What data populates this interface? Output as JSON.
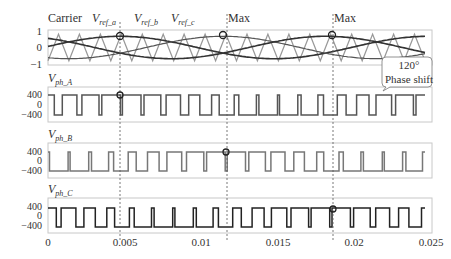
{
  "chart_data": [
    {
      "type": "line",
      "panel": "modulation",
      "title": "",
      "legend": [
        "Carrier",
        "V_ref_a",
        "V_ref_b",
        "V_ref_c"
      ],
      "yticks": [
        "1",
        "0",
        "-1"
      ],
      "ylim": [
        -1,
        1
      ],
      "xlim": [
        0,
        0.025
      ],
      "carrier": {
        "type": "triangle",
        "amplitude": 1,
        "cycles": 18
      },
      "series": [
        {
          "name": "V_ref_a",
          "amplitude": 0.8,
          "frequency_hz": 50,
          "phase_deg": 0
        },
        {
          "name": "V_ref_b",
          "amplitude": 0.8,
          "frequency_hz": 50,
          "phase_deg": -120
        },
        {
          "name": "V_ref_c",
          "amplitude": 0.8,
          "frequency_hz": 50,
          "phase_deg": 120
        }
      ],
      "annotations": [
        "Max",
        "Max"
      ],
      "markers_x": [
        0.0047,
        0.0117,
        0.0187
      ]
    },
    {
      "type": "line",
      "panel": "V_ph_A",
      "ylabel": "V_ph_A",
      "yticks": [
        "400",
        "0",
        "-400"
      ],
      "ylim": [
        -400,
        400
      ],
      "levels": [
        400,
        -400
      ]
    },
    {
      "type": "line",
      "panel": "V_ph_B",
      "ylabel": "V_ph_B",
      "yticks": [
        "400",
        "0",
        "-400"
      ],
      "ylim": [
        -400,
        400
      ],
      "levels": [
        400,
        -400
      ]
    },
    {
      "type": "line",
      "panel": "V_ph_C",
      "ylabel": "V_ph_C",
      "yticks": [
        "400",
        "0",
        "-400"
      ],
      "ylim": [
        -400,
        400
      ],
      "levels": [
        400,
        -400
      ]
    }
  ],
  "labels": {
    "carrier": "Carrier",
    "vref_a_main": "V",
    "vref_a_sub": "ref_a",
    "vref_b_main": "V",
    "vref_b_sub": "ref_b",
    "vref_c_main": "V",
    "vref_c_sub": "ref_c",
    "max1": "Max",
    "max2": "Max",
    "pha_main": "V",
    "pha_sub": "ph_A",
    "phb_main": "V",
    "phb_sub": "ph_B",
    "phc_main": "V",
    "phc_sub": "ph_C",
    "callout_line1": "120°",
    "callout_line2": "Phase shift"
  },
  "yticks_top": [
    "1",
    "0",
    "−1"
  ],
  "yticks_phase": [
    "400",
    "0",
    "−400"
  ],
  "xticks": [
    "0",
    "0.005",
    "0.01",
    "0.015",
    "0.02",
    "0.025"
  ],
  "colors": {
    "carrier": "#999999",
    "ref": "#333333",
    "phase_a": "#555555",
    "phase_b": "#777777",
    "phase_c": "#222222",
    "frame": "#cccccc"
  }
}
